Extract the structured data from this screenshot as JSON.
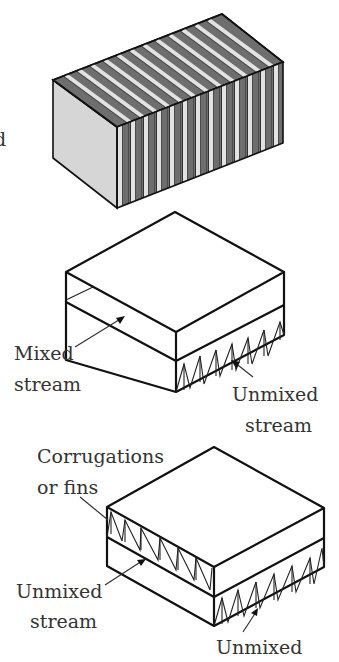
{
  "figure": {
    "panels": [
      {
        "id": "stacked-plates-block",
        "description": "Striped block of alternating plates",
        "colors": {
          "dark_stripe": "#6e6e6e",
          "light_stripe": "#e2e2e2",
          "end_face": "#d6d6d6",
          "edge": "#111111"
        },
        "stripe_count": 13,
        "partial_caption_glyph": "d"
      },
      {
        "id": "one-fluid-mixed",
        "labels": {
          "mixed_line1": "Mixed",
          "mixed_line2": "stream",
          "unmixed_line1": "Unmixed",
          "unmixed_line2": "stream"
        },
        "corrugation_count": 6
      },
      {
        "id": "both-fluids-unmixed",
        "labels": {
          "fins_line1": "Corrugations",
          "fins_line2": "or fins",
          "unmixed_left_line1": "Unmixed",
          "unmixed_left_line2": "stream",
          "unmixed_bottom": "Unmixed"
        },
        "corrugation_count_top_left": 6,
        "corrugation_count_bottom_right": 6
      }
    ]
  }
}
